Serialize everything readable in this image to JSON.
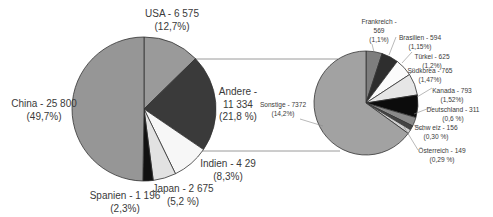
{
  "chart_data": [
    {
      "type": "pie",
      "title": "",
      "name": "main-pie",
      "center": [
        144,
        109
      ],
      "radius": 72,
      "start_angle_deg": 0,
      "direction": "clockwise",
      "slices": [
        {
          "label": "USA",
          "value": 6575,
          "value_text": "6 575",
          "percent_text": "(12,7%)",
          "color": "#9a9a9a"
        },
        {
          "label": "Andere",
          "value": 11334,
          "value_text": "11 334",
          "percent_text": "(21,8 %)",
          "color": "#3a3a3a"
        },
        {
          "label": "Indien",
          "value": 4290,
          "value_text": "4 29",
          "percent_text": "(8,3%)",
          "color": "#f7f7f7"
        },
        {
          "label": "Japan",
          "value": 2675,
          "value_text": "2 675",
          "percent_text": "(5,2 %)",
          "color": "#e2e2e2"
        },
        {
          "label": "Spanien",
          "value": 1196,
          "value_text": "1 196",
          "percent_text": "(2,3%)",
          "color": "#111111"
        },
        {
          "label": "China",
          "value": 25800,
          "value_text": "25 800",
          "percent_text": "(49,7%)",
          "color": "#969696"
        }
      ],
      "labels": [
        {
          "lines": [
            "USA - 6 575",
            "(12,7%)"
          ],
          "x": 172,
          "y": 17
        },
        {
          "lines": [
            "Andere -",
            "11 334",
            "(21,8 %)"
          ],
          "x": 238,
          "y": 95
        },
        {
          "lines": [
            "Indien - 4 29",
            "(8,3%)"
          ],
          "x": 228,
          "y": 167
        },
        {
          "lines": [
            "Japan - 2 675",
            "(5,2 %)"
          ],
          "x": 183,
          "y": 192
        },
        {
          "lines": [
            "Spanien - 1 196",
            "(2,3%)"
          ],
          "x": 125,
          "y": 199
        },
        {
          "lines": [
            "China - 25 800",
            "(49,7%)"
          ],
          "x": 44,
          "y": 107
        }
      ]
    },
    {
      "type": "pie",
      "title": "",
      "name": "breakdown-pie",
      "note": "Breakdown of 'Andere' (11 334)",
      "center": [
        366,
        103
      ],
      "radius": 52,
      "start_angle_deg": 0,
      "direction": "clockwise",
      "slices": [
        {
          "label": "Frankreich",
          "value": 569,
          "percent_text": "(1,1%)",
          "color": "#7e7e7e"
        },
        {
          "label": "Brasilien",
          "value": 594,
          "percent_text": "(1,15%)",
          "color": "#2e2e2e"
        },
        {
          "label": "Türkei",
          "value": 625,
          "percent_text": "(1,2%)",
          "color": "#fbfbfb"
        },
        {
          "label": "Südkorea",
          "value": 765,
          "percent_text": "(1,47%)",
          "color": "#e6e6e6"
        },
        {
          "label": "Kanada",
          "value": 793,
          "percent_text": "(1,52%)",
          "color": "#0c0c0c"
        },
        {
          "label": "Deutschland",
          "value": 311,
          "percent_text": "(0,6 %)",
          "color": "#8a8a8a"
        },
        {
          "label": "Schweiz",
          "value": 156,
          "percent_text": "(0,30 %)",
          "color": "#444444"
        },
        {
          "label": "Österreich",
          "value": 149,
          "percent_text": "(0,29 %)",
          "color": "#d0d0d0"
        },
        {
          "label": "Sonstige",
          "value": 7372,
          "percent_text": "(14,2%)",
          "color": "#a2a2a2"
        }
      ],
      "labels": [
        {
          "lines": [
            "Frankreich -",
            "569",
            "(1,1%)"
          ],
          "x": 379,
          "y": 24
        },
        {
          "lines": [
            "Brasilien - 594",
            "(1,15%)"
          ],
          "x": 420,
          "y": 40
        },
        {
          "lines": [
            "Türkei - 625",
            "(1,2%)"
          ],
          "x": 432,
          "y": 59
        },
        {
          "lines": [
            "Südkorea - 765",
            "(1,47%)"
          ],
          "x": 430,
          "y": 73
        },
        {
          "lines": [
            "Kanada - 793",
            "(1,52%)"
          ],
          "x": 452,
          "y": 93
        },
        {
          "lines": [
            "Deutschland - 311",
            "(0,6 %)"
          ],
          "x": 453,
          "y": 112
        },
        {
          "lines": [
            "Schw eiz - 156",
            "(0,30 %)"
          ],
          "x": 436,
          "y": 130
        },
        {
          "lines": [
            "Österreich - 149",
            "(0,29 %)"
          ],
          "x": 442,
          "y": 153
        },
        {
          "lines": [
            "Sonstige - 7372",
            "(14,2%)"
          ],
          "x": 283,
          "y": 107
        }
      ]
    }
  ],
  "connectors": [
    {
      "x1": 194,
      "y1": 59,
      "x2": 338,
      "y2": 59
    },
    {
      "x1": 202,
      "y1": 151,
      "x2": 340,
      "y2": 151
    }
  ],
  "colors": {
    "text": "#3a3a3a",
    "slice_stroke": "#333333",
    "connector": "#9a9a9a",
    "leader": "#8a8a8a"
  }
}
